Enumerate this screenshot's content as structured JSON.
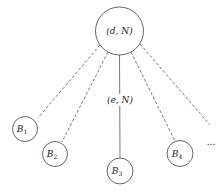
{
  "diagram": {
    "root": {
      "label": "(d, N)",
      "cx": 119.5,
      "cy": 31,
      "r": 24
    },
    "edge_label": "(e, N)",
    "children": [
      {
        "base": "B",
        "sub": "1",
        "cx": 25,
        "cy": 129,
        "r": 12.5,
        "edge": "dashed"
      },
      {
        "base": "B",
        "sub": "2",
        "cx": 55,
        "cy": 154,
        "r": 12.5,
        "edge": "dashed"
      },
      {
        "base": "B",
        "sub": "3",
        "cx": 120,
        "cy": 171,
        "r": 13,
        "edge": "solid"
      },
      {
        "base": "B",
        "sub": "4",
        "cx": 180,
        "cy": 153.5,
        "r": 13,
        "edge": "dashed"
      }
    ],
    "ellipsis": "..."
  }
}
